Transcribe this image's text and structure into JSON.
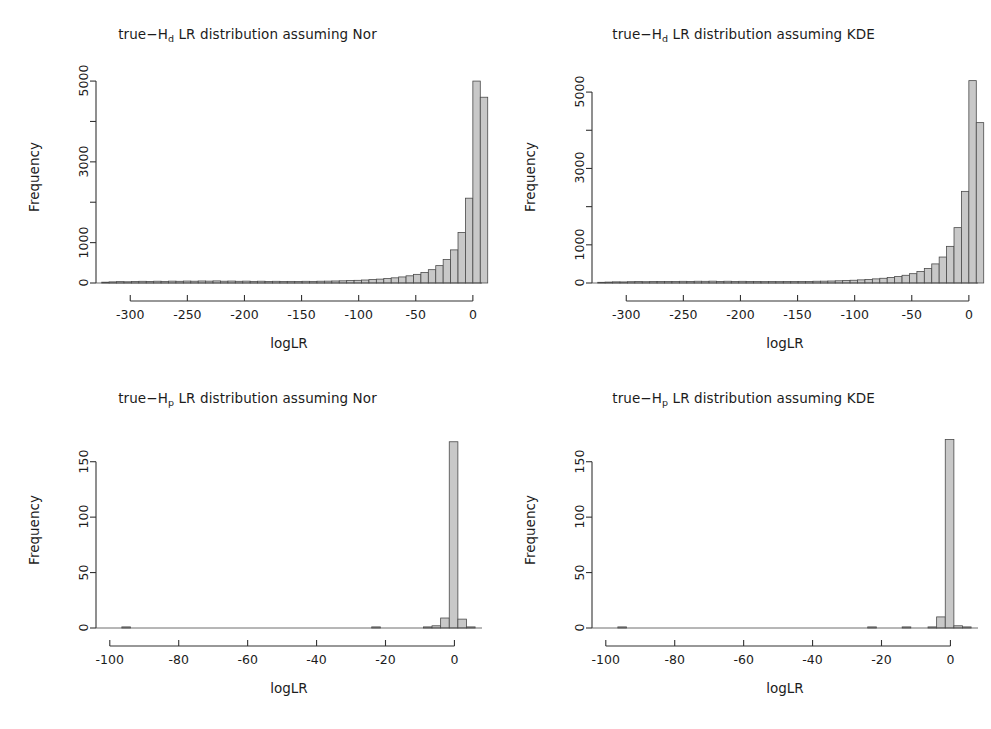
{
  "figure": {
    "background": "#ffffff",
    "axis_color": "#333333",
    "bar_fill": "#c8c8c8",
    "bar_stroke": "#4a4a4a",
    "text_color": "#1c1c1c"
  },
  "panels": [
    {
      "id": "top-left",
      "title_prefix": "true−H",
      "title_sub": "d",
      "title_suffix": " LR distribution assuming Nor",
      "title_full": "true−Hd LR distribution assuming Nor",
      "chart_data": {
        "type": "bar",
        "title": "true−Hd LR distribution assuming Nor",
        "xlabel": "logLR",
        "ylabel": "Frequency",
        "xlim": [
          -330,
          8
        ],
        "ylim": [
          0,
          5200
        ],
        "grid": false,
        "legend": "none",
        "xticks": [
          -300,
          -250,
          -200,
          -150,
          -100,
          -50,
          0
        ],
        "xtick_labels": [
          "-300",
          "-250",
          "-200",
          "-150",
          "-100",
          "-50",
          "0"
        ],
        "yticks": [
          0,
          1000,
          2000,
          3000,
          4000,
          5000
        ],
        "ytick_labels": [
          "0",
          "",
          "1000",
          "",
          "3000",
          "",
          "5000"
        ],
        "ytick_labeled": [
          0,
          1000,
          3000,
          5000
        ],
        "bin_width": 6.5,
        "bin_starts": [
          -325.0,
          -318.5,
          -312.0,
          -305.5,
          -299.0,
          -292.5,
          -286.0,
          -279.5,
          -273.0,
          -266.5,
          -260.0,
          -253.5,
          -247.0,
          -240.5,
          -234.0,
          -227.5,
          -221.0,
          -214.5,
          -208.0,
          -201.5,
          -195.0,
          -188.5,
          -182.0,
          -175.5,
          -169.0,
          -162.5,
          -156.0,
          -149.5,
          -143.0,
          -136.5,
          -130.0,
          -123.5,
          -117.0,
          -110.5,
          -104.0,
          -97.5,
          -91.0,
          -84.5,
          -78.0,
          -71.5,
          -65.0,
          -58.5,
          -52.0,
          -45.5,
          -39.0,
          -32.5,
          -26.0,
          -19.5,
          -13.0,
          -6.5,
          0.0
        ],
        "values": [
          20,
          28,
          34,
          30,
          38,
          42,
          36,
          44,
          40,
          46,
          42,
          48,
          44,
          50,
          46,
          52,
          44,
          48,
          42,
          46,
          40,
          44,
          38,
          42,
          36,
          40,
          38,
          42,
          40,
          44,
          46,
          50,
          54,
          60,
          66,
          74,
          84,
          96,
          110,
          128,
          150,
          178,
          214,
          262,
          330,
          430,
          580,
          820,
          1250,
          2100,
          5000
        ],
        "last_bar_value": 4600,
        "peak_value": 5000,
        "peak_bin": -6.5,
        "notes": "Heavily right-skewed histogram, long flat left tail, sharp peak at logLR near 0"
      }
    },
    {
      "id": "top-right",
      "title_prefix": "true−H",
      "title_sub": "d",
      "title_suffix": " LR distribution assuming KDE",
      "title_full": "true−Hd LR distribution assuming KDE",
      "chart_data": {
        "type": "bar",
        "title": "true−Hd LR distribution assuming KDE",
        "xlabel": "logLR",
        "ylabel": "Frequency",
        "xlim": [
          -330,
          8
        ],
        "ylim": [
          0,
          5500
        ],
        "grid": false,
        "legend": "none",
        "xticks": [
          -300,
          -250,
          -200,
          -150,
          -100,
          -50,
          0
        ],
        "xtick_labels": [
          "-300",
          "-250",
          "-200",
          "-150",
          "-100",
          "-50",
          "0"
        ],
        "yticks": [
          0,
          1000,
          2000,
          3000,
          4000,
          5000
        ],
        "ytick_labels": [
          "0",
          "",
          "1000",
          "",
          "3000",
          "",
          "5000"
        ],
        "ytick_labeled": [
          0,
          1000,
          3000,
          5000
        ],
        "bin_width": 6.5,
        "bin_starts": [
          -325.0,
          -318.5,
          -312.0,
          -305.5,
          -299.0,
          -292.5,
          -286.0,
          -279.5,
          -273.0,
          -266.5,
          -260.0,
          -253.5,
          -247.0,
          -240.5,
          -234.0,
          -227.5,
          -221.0,
          -214.5,
          -208.0,
          -201.5,
          -195.0,
          -188.5,
          -182.0,
          -175.5,
          -169.0,
          -162.5,
          -156.0,
          -149.5,
          -143.0,
          -136.5,
          -130.0,
          -123.5,
          -117.0,
          -110.5,
          -104.0,
          -97.5,
          -91.0,
          -84.5,
          -78.0,
          -71.5,
          -65.0,
          -58.5,
          -52.0,
          -45.5,
          -39.0,
          -32.5,
          -26.0,
          -19.5,
          -13.0,
          -6.5,
          0.0
        ],
        "values": [
          18,
          24,
          30,
          28,
          34,
          38,
          34,
          40,
          38,
          42,
          40,
          44,
          42,
          46,
          44,
          48,
          42,
          46,
          40,
          44,
          38,
          42,
          36,
          40,
          36,
          40,
          38,
          42,
          40,
          46,
          48,
          52,
          58,
          64,
          72,
          82,
          94,
          108,
          124,
          144,
          170,
          202,
          244,
          300,
          380,
          500,
          680,
          960,
          1450,
          2400,
          5300
        ],
        "last_bar_value": 4200,
        "peak_value": 5300,
        "peak_bin": -6.5,
        "notes": "Same shape as Nor panel but slightly higher peak"
      }
    },
    {
      "id": "bottom-left",
      "title_prefix": "true−H",
      "title_sub": "p",
      "title_suffix": " LR distribution assuming Nor",
      "title_full": "true−Hp LR distribution assuming Nor",
      "chart_data": {
        "type": "bar",
        "title": "true−Hp LR distribution assuming Nor",
        "xlabel": "logLR",
        "ylabel": "Frequency",
        "xlim": [
          -104,
          8
        ],
        "ylim": [
          0,
          175
        ],
        "grid": false,
        "legend": "none",
        "xticks": [
          -100,
          -80,
          -60,
          -40,
          -20,
          0
        ],
        "xtick_labels": [
          "-100",
          "-80",
          "-60",
          "-40",
          "-20",
          "0"
        ],
        "yticks": [
          0,
          50,
          100,
          150
        ],
        "ytick_labels": [
          "0",
          "50",
          "100",
          "150"
        ],
        "ytick_labeled": [
          0,
          50,
          100,
          150
        ],
        "bin_width": 2.5,
        "bin_starts": [
          -96.5,
          -94.0,
          -91.5,
          -89.0,
          -86.5,
          -84.0,
          -81.5,
          -79.0,
          -76.5,
          -74.0,
          -71.5,
          -69.0,
          -66.5,
          -64.0,
          -61.5,
          -59.0,
          -56.5,
          -54.0,
          -51.5,
          -49.0,
          -46.5,
          -44.0,
          -41.5,
          -39.0,
          -36.5,
          -34.0,
          -31.5,
          -29.0,
          -26.5,
          -24.0,
          -21.5,
          -19.0,
          -16.5,
          -14.0,
          -11.5,
          -9.0,
          -6.5,
          -4.0,
          -1.5,
          1.0,
          3.5
        ],
        "values": [
          1,
          0,
          0,
          0,
          0,
          0,
          0,
          0,
          0,
          0,
          0,
          0,
          0,
          0,
          0,
          0,
          0,
          0,
          0,
          0,
          0,
          0,
          0,
          0,
          0,
          0,
          0,
          0,
          0,
          1,
          0,
          0,
          0,
          0,
          0,
          1,
          2,
          9,
          168,
          8,
          1
        ],
        "peak_value": 168,
        "peak_bin": -1.5,
        "notes": "Nearly all mass concentrated in one narrow bin near logLR = 0"
      }
    },
    {
      "id": "bottom-right",
      "title_prefix": "true−H",
      "title_sub": "p",
      "title_suffix": " LR distribution assuming KDE",
      "title_full": "true−Hp LR distribution assuming KDE",
      "chart_data": {
        "type": "bar",
        "title": "true−Hp LR distribution assuming KDE",
        "xlabel": "logLR",
        "ylabel": "Frequency",
        "xlim": [
          -104,
          8
        ],
        "ylim": [
          0,
          175
        ],
        "grid": false,
        "legend": "none",
        "xticks": [
          -100,
          -80,
          -60,
          -40,
          -20,
          0
        ],
        "xtick_labels": [
          "-100",
          "-80",
          "-60",
          "-40",
          "-20",
          "0"
        ],
        "yticks": [
          0,
          50,
          100,
          150
        ],
        "ytick_labels": [
          "0",
          "50",
          "100",
          "150"
        ],
        "ytick_labeled": [
          0,
          50,
          100,
          150
        ],
        "bin_width": 2.5,
        "bin_starts": [
          -96.5,
          -94.0,
          -91.5,
          -89.0,
          -86.5,
          -84.0,
          -81.5,
          -79.0,
          -76.5,
          -74.0,
          -71.5,
          -69.0,
          -66.5,
          -64.0,
          -61.5,
          -59.0,
          -56.5,
          -54.0,
          -51.5,
          -49.0,
          -46.5,
          -44.0,
          -41.5,
          -39.0,
          -36.5,
          -34.0,
          -31.5,
          -29.0,
          -26.5,
          -24.0,
          -21.5,
          -19.0,
          -16.5,
          -14.0,
          -11.5,
          -9.0,
          -6.5,
          -4.0,
          -1.5,
          1.0,
          3.5
        ],
        "values": [
          1,
          0,
          0,
          0,
          0,
          0,
          0,
          0,
          0,
          0,
          0,
          0,
          0,
          0,
          0,
          0,
          0,
          0,
          0,
          0,
          0,
          0,
          0,
          0,
          0,
          0,
          0,
          0,
          0,
          1,
          0,
          0,
          0,
          1,
          0,
          0,
          1,
          10,
          170,
          2,
          1
        ],
        "peak_value": 170,
        "peak_bin": -1.5,
        "notes": "Nearly all mass concentrated in one narrow bin near logLR = 0"
      }
    }
  ]
}
